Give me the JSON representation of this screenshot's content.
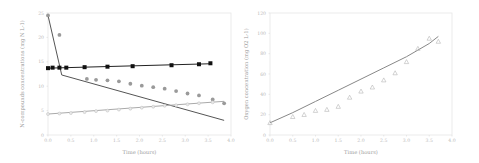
{
  "chart_data": [
    {
      "type": "scatter",
      "title": "",
      "xlabel": "Time (hours)",
      "ylabel": "N-compounds concentrations (mg N L-1)",
      "xlim": [
        0,
        4
      ],
      "ylim": [
        0,
        25
      ],
      "x_ticks": [
        "0.0",
        "0.5",
        "1.0",
        "1.5",
        "2.0",
        "2.5",
        "3.0",
        "3.5",
        "4.0"
      ],
      "y_ticks": [
        "0",
        "5",
        "10",
        "15",
        "20",
        "25"
      ],
      "grid": false,
      "legend": null,
      "series": [
        {
          "name": "measured-black-squares",
          "marker": "square",
          "color": "#111111",
          "x": [
            0.0,
            0.1,
            0.25,
            0.4,
            0.8,
            1.3,
            1.85,
            2.7,
            3.3,
            3.55
          ],
          "y": [
            13.7,
            13.8,
            13.8,
            13.8,
            13.9,
            14.0,
            14.1,
            14.3,
            14.5,
            14.7
          ]
        },
        {
          "name": "measured-gray-circles",
          "marker": "circle",
          "color": "#9a9a9a",
          "x": [
            0.0,
            0.25,
            0.85,
            1.05,
            1.3,
            1.55,
            1.8,
            2.05,
            2.3,
            2.55,
            2.8,
            3.05,
            3.3,
            3.6,
            3.85
          ],
          "y": [
            24.5,
            20.5,
            11.5,
            11.3,
            11.2,
            11.0,
            10.5,
            10.1,
            9.8,
            9.5,
            9.0,
            8.5,
            8.1,
            7.3,
            6.5
          ]
        },
        {
          "name": "measured-light-circles",
          "marker": "circle-open",
          "color": "#bdbdbd",
          "x": [
            0.0,
            0.25,
            0.5,
            0.8,
            1.05,
            1.3,
            1.55,
            1.8,
            2.05,
            2.3,
            2.55,
            2.8,
            3.05,
            3.3,
            3.6
          ],
          "y": [
            4.3,
            4.4,
            4.5,
            4.7,
            4.9,
            5.0,
            5.2,
            5.4,
            5.6,
            5.8,
            6.0,
            6.1,
            6.3,
            6.5,
            6.7
          ]
        },
        {
          "name": "model-black-line",
          "type": "line",
          "color": "#222222",
          "x": [
            0.0,
            3.55
          ],
          "y": [
            13.7,
            14.6
          ]
        },
        {
          "name": "model-gray-line",
          "type": "line",
          "color": "#555555",
          "x": [
            0.0,
            0.3,
            3.85
          ],
          "y": [
            24.5,
            12.3,
            3.0
          ]
        },
        {
          "name": "model-light-line",
          "type": "line",
          "color": "#aaaaaa",
          "x": [
            0.0,
            3.85
          ],
          "y": [
            4.3,
            6.9
          ]
        }
      ]
    },
    {
      "type": "scatter",
      "title": "",
      "xlabel": "Time (hours)",
      "ylabel": "Oxygen concentration (mg O2 L-1)",
      "xlim": [
        0,
        4
      ],
      "ylim": [
        0,
        120
      ],
      "x_ticks": [
        "0.0",
        "0.5",
        "1.0",
        "1.5",
        "2.0",
        "2.5",
        "3.0",
        "3.5",
        "4.0"
      ],
      "y_ticks": [
        "0",
        "20",
        "40",
        "60",
        "80",
        "100",
        "120"
      ],
      "grid": false,
      "legend": null,
      "series": [
        {
          "name": "measured-triangles",
          "marker": "triangle-open",
          "color": "#b5b5b5",
          "x": [
            0.0,
            0.5,
            0.75,
            1.0,
            1.25,
            1.5,
            1.75,
            2.0,
            2.25,
            2.5,
            2.75,
            3.0,
            3.25,
            3.5,
            3.7
          ],
          "y": [
            12,
            18,
            20,
            24,
            25,
            28,
            37,
            43,
            47,
            54,
            61,
            72,
            85,
            95,
            92
          ]
        },
        {
          "name": "model-line",
          "type": "line",
          "color": "#888888",
          "x": [
            0.0,
            0.5,
            1.0,
            1.5,
            2.0,
            2.5,
            3.0,
            3.5,
            3.7
          ],
          "y": [
            12,
            22,
            33,
            44,
            55,
            66,
            77,
            90,
            97
          ]
        }
      ]
    }
  ]
}
